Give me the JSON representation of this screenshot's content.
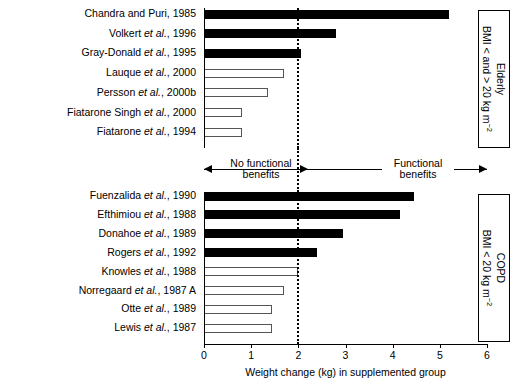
{
  "chart_data": {
    "type": "bar",
    "orientation": "horizontal",
    "title": "",
    "xlabel": "Weight change (kg) in supplemented group",
    "ylabel": "",
    "xlim": [
      0,
      6
    ],
    "xticks": [
      0,
      1,
      2,
      3,
      4,
      5,
      6
    ],
    "xticklabels": [
      "0",
      "1",
      "2",
      "3",
      "4",
      "5",
      "6"
    ],
    "grid": false,
    "reference_line": {
      "value": 2.0,
      "style": "dotted",
      "color": "#000000"
    },
    "fill_legend": {
      "filled": "Functional benefits (weight change >= 2 kg)",
      "open": "No functional benefits (weight change < 2 kg)"
    },
    "groups": [
      {
        "name": "Elderly",
        "box_label_line1": "Elderly",
        "box_label_line2": "BMI < and > 20 kg m",
        "box_label_sup": "−2",
        "categories": [
          "Chandra and Puri, 1985",
          "Volkert et al., 1996",
          "Gray-Donald et al., 1995",
          "Lauque et al., 2000",
          "Persson et al., 2000b",
          "Fiatarone Singh et al., 2000",
          "Fiatarone et al., 1994"
        ],
        "values": [
          5.2,
          2.8,
          2.05,
          1.7,
          1.35,
          0.8,
          0.8
        ],
        "fills": [
          "filled",
          "filled",
          "filled",
          "open",
          "open",
          "open",
          "open"
        ]
      },
      {
        "name": "COPD",
        "box_label_line1": "COPD",
        "box_label_line2": "BMI < 20 kg m",
        "box_label_sup": "−2",
        "categories": [
          "Fuenzalida et al., 1990",
          "Efthimiou et al., 1988",
          "Donahoe et al., 1989",
          "Rogers et al., 1992",
          "Knowles et al., 1988",
          "Norregaard et al., 1987 A",
          "Otte et al., 1989",
          "Lewis et al., 1987"
        ],
        "values": [
          4.45,
          4.15,
          2.95,
          2.4,
          2.0,
          1.7,
          1.45,
          1.45
        ],
        "fills": [
          "filled",
          "filled",
          "filled",
          "filled",
          "open",
          "open",
          "open",
          "open"
        ]
      }
    ],
    "annotations": {
      "left_text_line1": "No functional",
      "left_text_line2": "benefits",
      "right_text_line1": "Functional",
      "right_text_line2": "benefits"
    }
  },
  "row_labels": {
    "elderly": [
      {
        "plain": "Chandra and Puri, 1985",
        "pre": "Chandra and Puri, 1985",
        "ital": "",
        "post": ""
      },
      {
        "plain": "Volkert et al., 1996",
        "pre": "Volkert ",
        "ital": "et al.",
        "post": ", 1996"
      },
      {
        "plain": "Gray-Donald et al., 1995",
        "pre": "Gray-Donald ",
        "ital": "et al.",
        "post": ", 1995"
      },
      {
        "plain": "Lauque et al., 2000",
        "pre": "Lauque ",
        "ital": "et al.",
        "post": ", 2000"
      },
      {
        "plain": "Persson et al., 2000b",
        "pre": "Persson ",
        "ital": "et al.",
        "post": ", 2000b"
      },
      {
        "plain": "Fiatarone Singh et al., 2000",
        "pre": "Fiatarone Singh ",
        "ital": "et al.",
        "post": ", 2000"
      },
      {
        "plain": "Fiatarone et al., 1994",
        "pre": "Fiatarone ",
        "ital": "et al.",
        "post": ", 1994"
      }
    ],
    "copd": [
      {
        "plain": "Fuenzalida et al., 1990",
        "pre": "Fuenzalida ",
        "ital": "et al.",
        "post": ", 1990"
      },
      {
        "plain": "Efthimiou et al., 1988",
        "pre": "Efthimiou ",
        "ital": "et al.",
        "post": ", 1988"
      },
      {
        "plain": "Donahoe et al., 1989",
        "pre": "Donahoe ",
        "ital": "et al.",
        "post": ", 1989"
      },
      {
        "plain": "Rogers et al., 1992",
        "pre": "Rogers ",
        "ital": "et al.",
        "post": ", 1992"
      },
      {
        "plain": "Knowles et al., 1988",
        "pre": "Knowles ",
        "ital": "et al.",
        "post": ", 1988"
      },
      {
        "plain": "Norregaard et al., 1987 A",
        "pre": "Norregaard ",
        "ital": "et al.",
        "post": ", 1987 A"
      },
      {
        "plain": "Otte et al., 1989",
        "pre": "Otte ",
        "ital": "et al.",
        "post": ", 1989"
      },
      {
        "plain": "Lewis et al., 1987",
        "pre": "Lewis ",
        "ital": "et al.",
        "post": ", 1987"
      }
    ]
  },
  "colors": {
    "filled_bar": "#000000",
    "open_bar_fill": "#ffffff",
    "open_bar_border": "#555555",
    "axis": "#000000",
    "background": "#ffffff"
  }
}
